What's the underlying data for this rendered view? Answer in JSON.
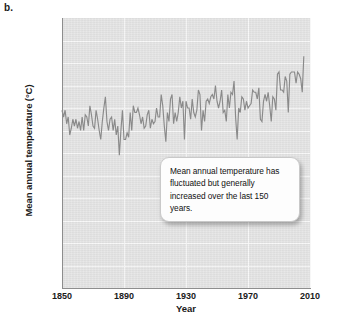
{
  "panel": {
    "label": "b."
  },
  "callout": {
    "text": "Mean annual temperature has fluctuated but generally increased over the last 150 years."
  },
  "chart_data": {
    "type": "line",
    "title": "",
    "xlabel": "Year",
    "ylabel": "Mean annual temperature (°C)",
    "xlim": [
      1850,
      2010
    ],
    "ylim": [
      0.0,
      12.0
    ],
    "xticks": [
      "1850",
      "1890",
      "1930",
      "1970",
      "2010"
    ],
    "yticks": [
      "0.0",
      "1.0",
      "2.0",
      "3.0",
      "4.0",
      "5.0",
      "6.0",
      "7.0",
      "8.0",
      "9.0",
      "10.0",
      "11.0",
      "12.0"
    ],
    "grid": true,
    "legend": "none",
    "line_color": "#8a8a8a",
    "plot_background": "#e3e3e3",
    "series": [
      {
        "name": "Mean annual temperature",
        "x": [
          1850,
          1851,
          1852,
          1853,
          1854,
          1855,
          1856,
          1857,
          1858,
          1859,
          1860,
          1861,
          1862,
          1863,
          1864,
          1865,
          1866,
          1867,
          1868,
          1869,
          1870,
          1871,
          1872,
          1873,
          1874,
          1875,
          1876,
          1877,
          1878,
          1879,
          1880,
          1881,
          1882,
          1883,
          1884,
          1885,
          1886,
          1887,
          1888,
          1889,
          1890,
          1891,
          1892,
          1893,
          1894,
          1895,
          1896,
          1897,
          1898,
          1899,
          1900,
          1901,
          1902,
          1903,
          1904,
          1905,
          1906,
          1907,
          1908,
          1909,
          1910,
          1911,
          1912,
          1913,
          1914,
          1915,
          1916,
          1917,
          1918,
          1919,
          1920,
          1921,
          1922,
          1923,
          1924,
          1925,
          1926,
          1927,
          1928,
          1929,
          1930,
          1931,
          1932,
          1933,
          1934,
          1935,
          1936,
          1937,
          1938,
          1939,
          1940,
          1941,
          1942,
          1943,
          1944,
          1945,
          1946,
          1947,
          1948,
          1949,
          1950,
          1951,
          1952,
          1953,
          1954,
          1955,
          1956,
          1957,
          1958,
          1959,
          1960,
          1961,
          1962,
          1963,
          1964,
          1965,
          1966,
          1967,
          1968,
          1969,
          1970,
          1971,
          1972,
          1973,
          1974,
          1975,
          1976,
          1977,
          1978,
          1979,
          1980,
          1981,
          1982,
          1983,
          1984,
          1985,
          1986,
          1987,
          1988,
          1989,
          1990,
          1991,
          1992,
          1993,
          1994,
          1995,
          1996,
          1997,
          1998,
          1999,
          2000,
          2001,
          2002,
          2003,
          2004,
          2005,
          2006
        ],
        "values": [
          7.9,
          7.6,
          7.9,
          7.3,
          7.6,
          6.8,
          7.1,
          7.5,
          7.2,
          7.5,
          7.1,
          7.4,
          7.0,
          7.6,
          7.0,
          7.7,
          7.6,
          7.2,
          8.1,
          7.7,
          7.2,
          7.1,
          7.9,
          7.5,
          7.0,
          6.6,
          7.4,
          8.0,
          8.5,
          7.4,
          7.0,
          7.5,
          7.6,
          7.0,
          7.5,
          6.8,
          7.2,
          5.9,
          7.0,
          7.9,
          6.6,
          6.6,
          6.9,
          6.7,
          7.8,
          7.0,
          8.1,
          7.8,
          7.8,
          8.0,
          7.7,
          7.3,
          7.6,
          7.1,
          7.2,
          7.7,
          7.9,
          7.1,
          7.5,
          7.3,
          7.4,
          8.0,
          7.6,
          7.6,
          8.6,
          8.1,
          7.2,
          6.5,
          7.8,
          7.4,
          8.4,
          8.6,
          7.3,
          7.8,
          7.4,
          7.8,
          8.5,
          8.0,
          8.3,
          6.6,
          8.3,
          8.0,
          8.0,
          7.5,
          8.4,
          7.8,
          7.6,
          7.9,
          8.8,
          8.6,
          7.0,
          7.9,
          7.4,
          8.3,
          8.4,
          8.2,
          8.5,
          8.6,
          8.4,
          9.0,
          8.3,
          8.0,
          8.3,
          8.8,
          7.8,
          7.9,
          7.4,
          8.6,
          8.0,
          8.7,
          8.6,
          9.2,
          7.6,
          6.6,
          8.0,
          7.8,
          8.5,
          8.4,
          7.9,
          8.3,
          8.0,
          8.1,
          8.2,
          8.8,
          8.7,
          8.7,
          8.4,
          8.9,
          7.5,
          7.4,
          8.3,
          8.6,
          8.3,
          8.7,
          8.1,
          7.4,
          8.5,
          8.4,
          7.9,
          9.5,
          9.6,
          8.8,
          8.8,
          8.7,
          9.4,
          9.2,
          7.8,
          9.5,
          9.6,
          9.6,
          9.6,
          9.1,
          9.6,
          9.5,
          9.3,
          8.7,
          10.3
        ]
      }
    ]
  }
}
